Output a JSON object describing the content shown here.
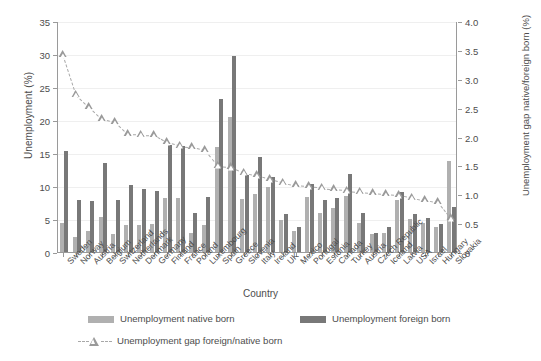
{
  "chart_data": {
    "type": "bar",
    "title": "",
    "xlabel": "Country",
    "ylabel": "Unemployment (%)",
    "ylabel_right": "Unemployment gap native/foreign born (%)",
    "ylim": [
      0,
      35
    ],
    "ylim_right": [
      0,
      4.0
    ],
    "yticks": [
      "0",
      "5",
      "10",
      "15",
      "20",
      "25",
      "30",
      "35"
    ],
    "yticks_right": [
      "0",
      "0.5",
      "1.0",
      "1.5",
      "2.0",
      "2.5",
      "3.0",
      "3.5",
      "4.0"
    ],
    "grid": true,
    "legend_position": "bottom",
    "categories": [
      "Sweden",
      "Norway",
      "Austria",
      "Belgium",
      "Switzerland",
      "Netherlands",
      "Denmark",
      "Germany",
      "Finland",
      "France",
      "Poland",
      "Luxembourg",
      "Spain",
      "Greece",
      "Slovenia",
      "Italy",
      "Ireland",
      "UK",
      "Mexico",
      "Portugal",
      "Estonia",
      "Canada",
      "Turkey",
      "Austria",
      "Czech Republic",
      "Iceland",
      "Latvia",
      "USA",
      "Israel",
      "Hungary",
      "Slovakia"
    ],
    "series": [
      {
        "name": "Unemployment native born",
        "color": "#b0b0b0",
        "values": [
          4.5,
          2.5,
          3.4,
          5.5,
          2.9,
          4.2,
          4.3,
          4.4,
          8.3,
          8.3,
          3.1,
          4.3,
          16.0,
          20.6,
          8.2,
          9.0,
          10.0,
          5.0,
          3.3,
          8.5,
          6.1,
          6.8,
          8.6,
          4.5,
          2.9,
          3.1,
          8.0,
          5.2,
          4.5,
          3.9,
          14.0
        ]
      },
      {
        "name": "Unemployment foreign born",
        "color": "#787878",
        "values": [
          15.4,
          8.0,
          7.9,
          13.6,
          8.0,
          10.3,
          9.7,
          9.4,
          16.4,
          16.2,
          6.1,
          8.5,
          23.3,
          29.8,
          11.8,
          14.5,
          11.5,
          5.9,
          4.0,
          10.5,
          8.1,
          8.4,
          11.9,
          6.1,
          3.0,
          4.0,
          9.2,
          5.9,
          5.3,
          4.4,
          7.0
        ]
      }
    ],
    "gap_series": {
      "name": "Unemployment gap foreign/native born",
      "marker": "triangle-up",
      "linestyle": "dashed",
      "color": "#9a9a9a",
      "axis": "right",
      "values": [
        3.42,
        2.74,
        2.53,
        2.32,
        2.27,
        2.06,
        2.05,
        2.04,
        1.92,
        1.86,
        1.83,
        1.78,
        1.51,
        1.49,
        1.39,
        1.35,
        1.28,
        1.22,
        1.18,
        1.16,
        1.13,
        1.1,
        1.08,
        1.06,
        1.04,
        1.02,
        1.0,
        0.96,
        0.92,
        0.88,
        0.6
      ]
    }
  },
  "axes": {
    "left": {
      "label": "Unemployment (%)",
      "ticks": [
        "35",
        "30",
        "25",
        "20",
        "15",
        "10",
        "5",
        "0"
      ]
    },
    "right": {
      "label": "Unemployment gap native/foreign born (%)",
      "ticks": [
        "4.0",
        "3.5",
        "3.0",
        "2.5",
        "2.0",
        "1.5",
        "1.0",
        "0.5",
        "0"
      ]
    },
    "x": {
      "label": "Country"
    }
  },
  "legend": {
    "items": [
      {
        "label": "Unemployment native born",
        "type": "swatch",
        "color": "#b0b0b0"
      },
      {
        "label": "Unemployment foreign born",
        "type": "swatch",
        "color": "#787878"
      },
      {
        "label": "Unemployment gap foreign/native born",
        "type": "marker",
        "color": "#9a9a9a"
      }
    ]
  }
}
